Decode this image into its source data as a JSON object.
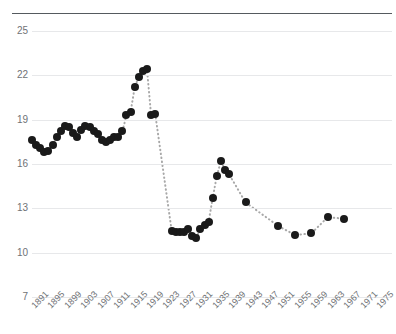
{
  "header": {
    "clipped_text": "",
    "has_top_rule": true
  },
  "chart_data": {
    "type": "scatter",
    "title": "",
    "subtitle": "",
    "xlabel": "",
    "ylabel": "",
    "xlim": [
      1891,
      1975
    ],
    "ylim": [
      7,
      25
    ],
    "grid": true,
    "legend": null,
    "marker_color": "#1a1a1a",
    "line_style": "dotted",
    "line_color": "#a8a8a8",
    "grid_color": "#e7e8ea",
    "axis_text_color": "#6f7276",
    "ytick_labels": [
      "25",
      "22",
      "19",
      "16",
      "13",
      "10",
      "7"
    ],
    "ytick_values": [
      25,
      22,
      19,
      16,
      13,
      10,
      7
    ],
    "xtick_labels": [
      "1891",
      "1895",
      "1899",
      "1903",
      "1907",
      "1911",
      "1915",
      "1919",
      "1923",
      "1927",
      "1931",
      "1935",
      "1939",
      "1943",
      "1947",
      "1951",
      "1955",
      "1959",
      "1963",
      "1967",
      "1971",
      "1975"
    ],
    "xtick_values": [
      1891,
      1895,
      1899,
      1903,
      1907,
      1911,
      1915,
      1919,
      1923,
      1927,
      1931,
      1935,
      1939,
      1943,
      1947,
      1951,
      1955,
      1959,
      1963,
      1967,
      1971,
      1975
    ],
    "x": [
      1891,
      1892,
      1893,
      1894,
      1895,
      1896,
      1897,
      1898,
      1899,
      1900,
      1901,
      1902,
      1903,
      1904,
      1905,
      1906,
      1907,
      1908,
      1909,
      1910,
      1911,
      1912,
      1913,
      1914,
      1915,
      1916,
      1917,
      1918,
      1919,
      1920,
      1921,
      1925,
      1926,
      1927,
      1928,
      1929,
      1930,
      1931,
      1932,
      1933,
      1934,
      1935,
      1936,
      1937,
      1938,
      1939,
      1943,
      1951,
      1955,
      1959,
      1963,
      1967
    ],
    "values": [
      17.6,
      17.3,
      17.1,
      16.8,
      16.9,
      17.3,
      17.8,
      18.2,
      18.6,
      18.5,
      18.1,
      17.8,
      18.3,
      18.6,
      18.5,
      18.2,
      18.0,
      17.6,
      17.5,
      17.6,
      17.8,
      17.8,
      18.2,
      19.3,
      19.5,
      21.2,
      21.9,
      22.3,
      22.4,
      19.3,
      19.4,
      11.5,
      11.4,
      11.4,
      11.4,
      11.6,
      11.1,
      11.0,
      11.6,
      11.9,
      12.1,
      13.7,
      15.2,
      16.2,
      15.6,
      15.3,
      13.4,
      11.8,
      11.2,
      11.3,
      12.4,
      12.3
    ],
    "connected": true
  }
}
